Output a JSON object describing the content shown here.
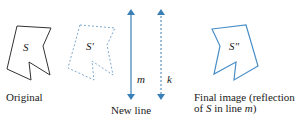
{
  "labels": {
    "s": "S",
    "s_prime": "S'",
    "s_double_prime": "S\"",
    "m": "m",
    "k": "k",
    "original": "Original",
    "new_line": "New line",
    "final_line1": "Final image (reflection",
    "final_line2_pre": "of ",
    "final_line2_s": "S",
    "final_line2_mid": " in line ",
    "final_line2_m": "m",
    "final_line2_post": ")"
  },
  "colors": {
    "original": "#333333",
    "image": "#4a8fc7",
    "dashed": "#7fa9cf",
    "line": "#3a7fb5"
  }
}
